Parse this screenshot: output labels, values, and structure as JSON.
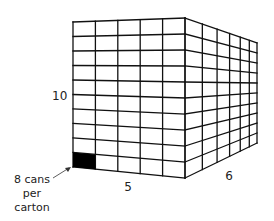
{
  "diagram": {
    "type": "3d-box-grid",
    "dimensions": {
      "height": {
        "label": "10",
        "count": 10
      },
      "width": {
        "label": "5",
        "count": 5
      },
      "depth": {
        "label": "6",
        "count": 6
      }
    },
    "highlighted_cell": {
      "row": "bottom",
      "col": "left",
      "color": "#000000"
    },
    "annotation": {
      "lines": [
        "8 cans",
        "per",
        "carton"
      ]
    },
    "colors": {
      "line": "#111111",
      "fill": "#ffffff",
      "highlight": "#000000"
    }
  }
}
